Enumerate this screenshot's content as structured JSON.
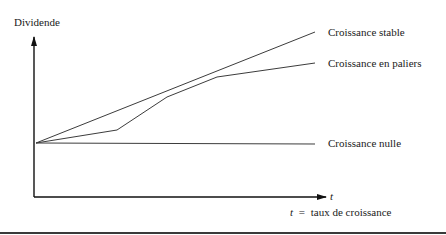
{
  "diagram": {
    "y_axis_label": "Dividende",
    "x_axis_label": "t",
    "legend_note": {
      "symbol": "t",
      "equals": "=",
      "text": "taux de croissance"
    },
    "series": [
      {
        "name": "Croissance stable",
        "points": [
          [
            36,
            143
          ],
          [
            315,
            32
          ]
        ]
      },
      {
        "name": "Croissance en paliers",
        "points": [
          [
            36,
            143
          ],
          [
            117,
            130
          ],
          [
            167,
            97
          ],
          [
            217,
            77
          ],
          [
            315,
            63
          ]
        ]
      },
      {
        "name": "Croissance nulle",
        "points": [
          [
            36,
            143
          ],
          [
            315,
            144
          ]
        ]
      }
    ],
    "colors": {
      "line": "#3c3c3c",
      "axis": "#111111"
    }
  }
}
